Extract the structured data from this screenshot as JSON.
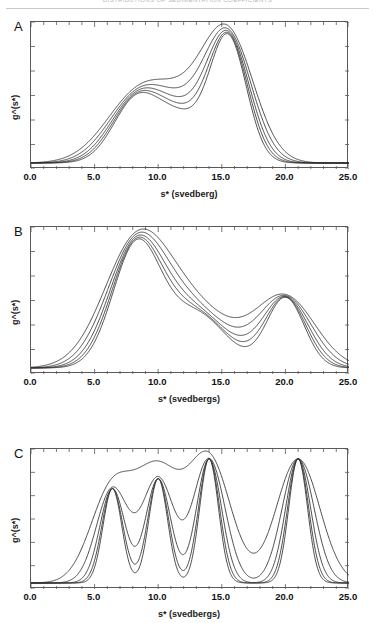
{
  "header": {
    "text": "DISTRIBUTIONS OF SEDIMENTATION COEFFICIENTS"
  },
  "figure": {
    "panels": [
      {
        "letter": "A",
        "xlabel": "s*   (svedberg)",
        "ylabel": "g^(s*)",
        "xticks": [
          "0.0",
          "5.0",
          "10.0",
          "15.0",
          "20.0",
          "25.0"
        ]
      },
      {
        "letter": "B",
        "xlabel": "s*   (svedbergs)",
        "ylabel": "g^(s*)",
        "xticks": [
          "0.0",
          "5.0",
          "10.0",
          "15.0",
          "20.0",
          "25.0"
        ]
      },
      {
        "letter": "C",
        "xlabel": "s*   (svedbergs)",
        "ylabel": "g^(s*)",
        "xticks": [
          "0.0",
          "5.0",
          "10.0",
          "15.0",
          "20.0",
          "25.0"
        ]
      }
    ]
  },
  "chart_data": [
    {
      "type": "line",
      "panel": "A",
      "title": "",
      "xlabel": "s*   (svedberg)",
      "ylabel": "g^(s*)",
      "xlim": [
        0.0,
        25.0
      ],
      "ylim": [
        0.0,
        1.05
      ],
      "xticks": [
        0.0,
        5.0,
        10.0,
        15.0,
        20.0,
        25.0
      ],
      "xticklabels": [
        "0.0",
        "5.0",
        "10.0",
        "15.0",
        "20.0",
        "25.0"
      ],
      "yticks_labeled": false,
      "grid": false,
      "legend": false,
      "n_series": 5,
      "description": "Family of five g^(s*) distributions: broad shoulder near s*=8-10 and a dominant peak near s*=15.5; curves sharpen with increasing broadening parameter.",
      "components": [
        {
          "center": 8.3,
          "amplitude": 0.47,
          "widths": [
            2.55,
            2.3,
            2.1,
            1.95,
            1.82
          ]
        },
        {
          "center": 15.5,
          "amplitude": 0.93,
          "widths": [
            2.05,
            1.85,
            1.68,
            1.55,
            1.44
          ]
        },
        {
          "center": 11.8,
          "amplitude": 0.3,
          "widths": [
            2.4,
            2.2,
            2.05,
            1.92,
            1.82
          ]
        }
      ],
      "series": [
        {
          "name": "curve-1",
          "broadening": 1.0,
          "peak_x": 15.5,
          "peak_y": 0.9
        },
        {
          "name": "curve-2",
          "broadening": 0.9,
          "peak_x": 15.5,
          "peak_y": 0.95
        },
        {
          "name": "curve-3",
          "broadening": 0.82,
          "peak_x": 15.5,
          "peak_y": 0.98
        },
        {
          "name": "curve-4",
          "broadening": 0.75,
          "peak_x": 15.6,
          "peak_y": 1.0
        },
        {
          "name": "curve-5",
          "broadening": 0.7,
          "peak_x": 15.6,
          "peak_y": 1.0
        }
      ]
    },
    {
      "type": "line",
      "panel": "B",
      "title": "",
      "xlabel": "s*   (svedbergs)",
      "ylabel": "g^(s*)",
      "xlim": [
        0.0,
        25.0
      ],
      "ylim": [
        0.0,
        1.05
      ],
      "xticks": [
        0.0,
        5.0,
        10.0,
        15.0,
        20.0,
        25.0
      ],
      "xticklabels": [
        "0.0",
        "5.0",
        "10.0",
        "15.0",
        "20.0",
        "25.0"
      ],
      "yticks_labeled": false,
      "grid": false,
      "legend": false,
      "n_series": 5,
      "description": "Family of five g^(s*) distributions: main peak near s*=8.3, broad trough near s*=16, and a secondary shoulder/peak near s*=20.",
      "components": [
        {
          "center": 8.3,
          "amplitude": 0.95,
          "widths": [
            2.6,
            2.35,
            2.15,
            2.0,
            1.88
          ]
        },
        {
          "center": 13.0,
          "amplitude": 0.42,
          "widths": [
            3.0,
            2.8,
            2.62,
            2.48,
            2.36
          ]
        },
        {
          "center": 20.0,
          "amplitude": 0.55,
          "widths": [
            2.35,
            2.05,
            1.8,
            1.62,
            1.48
          ]
        }
      ],
      "series": [
        {
          "name": "curve-1",
          "broadening": 1.0,
          "peak_x": 8.3,
          "peak_y": 0.92
        },
        {
          "name": "curve-2",
          "broadening": 0.9,
          "peak_x": 8.3,
          "peak_y": 0.95
        },
        {
          "name": "curve-3",
          "broadening": 0.82,
          "peak_x": 8.3,
          "peak_y": 0.97
        },
        {
          "name": "curve-4",
          "broadening": 0.75,
          "peak_x": 8.4,
          "peak_y": 0.99
        },
        {
          "name": "curve-5",
          "broadening": 0.7,
          "peak_x": 8.4,
          "peak_y": 1.0
        }
      ]
    },
    {
      "type": "line",
      "panel": "C",
      "title": "",
      "xlabel": "s*   (svedbergs)",
      "ylabel": "g^(s*)",
      "xlim": [
        0.0,
        25.0
      ],
      "ylim": [
        0.0,
        1.05
      ],
      "xticks": [
        0.0,
        5.0,
        10.0,
        15.0,
        20.0,
        25.0
      ],
      "xticklabels": [
        "0.0",
        "5.0",
        "10.0",
        "15.0",
        "20.0",
        "25.0"
      ],
      "yticks_labeled": false,
      "grid": false,
      "legend": false,
      "n_series": 5,
      "description": "Family of five g^(s*) distributions resolving four discrete species at s*=6.4, 10.0, 14.0 and 21.0; peaks sharpen and grow as resolution increases, the broadest curve merging the first two peaks into a plateau.",
      "peaks_s": [
        6.4,
        10.0,
        14.0,
        21.0
      ],
      "components": [
        {
          "center": 6.4,
          "amplitude": 0.76,
          "widths": [
            1.7,
            1.25,
            0.98,
            0.83,
            0.74
          ]
        },
        {
          "center": 10.0,
          "amplitude": 0.84,
          "widths": [
            1.7,
            1.25,
            0.98,
            0.83,
            0.74
          ]
        },
        {
          "center": 14.0,
          "amplitude": 1.0,
          "widths": [
            1.7,
            1.25,
            0.98,
            0.83,
            0.74
          ]
        },
        {
          "center": 21.0,
          "amplitude": 1.0,
          "widths": [
            1.7,
            1.25,
            0.98,
            0.83,
            0.74
          ]
        }
      ],
      "series": [
        {
          "name": "curve-1",
          "broadening": 1.0,
          "peak_y_max": 0.55
        },
        {
          "name": "curve-2",
          "broadening": 0.74,
          "peak_y_max": 0.72
        },
        {
          "name": "curve-3",
          "broadening": 0.58,
          "peak_y_max": 0.84
        },
        {
          "name": "curve-4",
          "broadening": 0.49,
          "peak_y_max": 0.93
        },
        {
          "name": "curve-5",
          "broadening": 0.435,
          "peak_y_max": 1.0
        }
      ]
    }
  ],
  "geometry": {
    "panels": [
      {
        "letter": "A",
        "plot_x": 30,
        "plot_y": 21,
        "plot_w": 318,
        "plot_h": 147,
        "letter_x": 14,
        "letter_y": 19,
        "xlab_y": 189,
        "xtick_y": 171,
        "ylab_x": 10,
        "ylab_y": 120
      },
      {
        "letter": "B",
        "plot_x": 30,
        "plot_y": 226,
        "plot_w": 318,
        "plot_h": 147,
        "letter_x": 14,
        "letter_y": 224,
        "xlab_y": 394,
        "xtick_y": 376,
        "ylab_x": 10,
        "ylab_y": 325
      },
      {
        "letter": "C",
        "plot_x": 30,
        "plot_y": 448,
        "plot_w": 318,
        "plot_h": 140,
        "letter_x": 14,
        "letter_y": 446,
        "xlab_y": 609,
        "xtick_y": 591,
        "ylab_x": 10,
        "ylab_y": 543
      }
    ],
    "n_xminor": 4,
    "n_yticks": 6
  }
}
